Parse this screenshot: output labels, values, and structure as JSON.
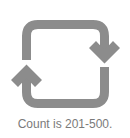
{
  "icon": {
    "name": "refresh-cycle-icon",
    "color": "#8c8c8c"
  },
  "caption": {
    "text": "Count is 201-500.",
    "color": "#7a7a7a"
  }
}
